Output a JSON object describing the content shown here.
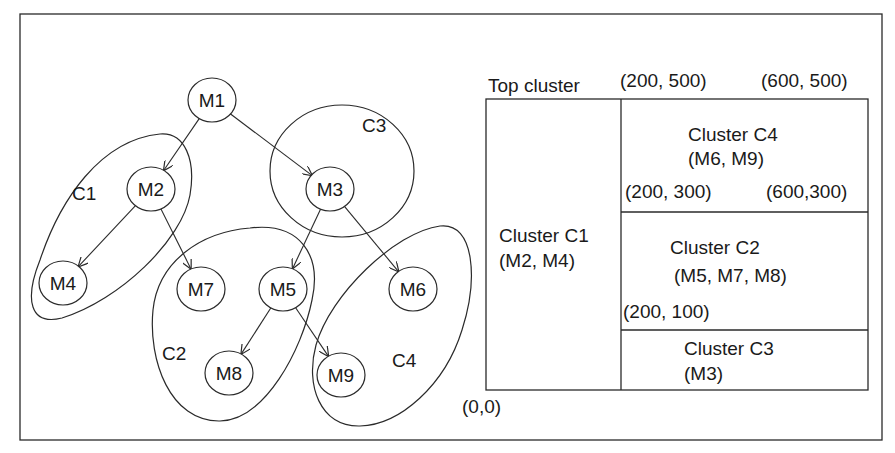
{
  "colors": {
    "stroke": "#2a2a2a",
    "text": "#1a1a1a",
    "background": "#ffffff"
  },
  "graph": {
    "nodes": [
      {
        "id": "M1",
        "label": "M1",
        "x": 212,
        "y": 100
      },
      {
        "id": "M2",
        "label": "M2",
        "x": 151,
        "y": 189
      },
      {
        "id": "M3",
        "label": "M3",
        "x": 330,
        "y": 189
      },
      {
        "id": "M4",
        "label": "M4",
        "x": 63,
        "y": 283
      },
      {
        "id": "M7",
        "label": "M7",
        "x": 201,
        "y": 289
      },
      {
        "id": "M5",
        "label": "M5",
        "x": 283,
        "y": 289
      },
      {
        "id": "M6",
        "label": "M6",
        "x": 413,
        "y": 289
      },
      {
        "id": "M8",
        "label": "M8",
        "x": 229,
        "y": 373
      },
      {
        "id": "M9",
        "label": "M9",
        "x": 341,
        "y": 375
      }
    ],
    "edges": [
      {
        "from": "M1",
        "to": "M2"
      },
      {
        "from": "M1",
        "to": "M3"
      },
      {
        "from": "M2",
        "to": "M4"
      },
      {
        "from": "M2",
        "to": "M7"
      },
      {
        "from": "M3",
        "to": "M5"
      },
      {
        "from": "M3",
        "to": "M6"
      },
      {
        "from": "M5",
        "to": "M8"
      },
      {
        "from": "M5",
        "to": "M9"
      }
    ],
    "clusters": [
      {
        "id": "C1",
        "label": "C1",
        "label_x": 72,
        "label_y": 200
      },
      {
        "id": "C2",
        "label": "C2",
        "label_x": 162,
        "label_y": 360
      },
      {
        "id": "C3",
        "label": "C3",
        "label_x": 362,
        "label_y": 132
      },
      {
        "id": "C4",
        "label": "C4",
        "label_x": 392,
        "label_y": 367
      }
    ]
  },
  "floorplan": {
    "top_label": "Top cluster",
    "corner_labels": {
      "top_left": "(200, 500)",
      "top_right": "(600, 500)",
      "mid_left": "(200, 300)",
      "mid_right": "(600,300)",
      "low_left": "(200, 100)",
      "origin": "(0,0)"
    },
    "regions": [
      {
        "id": "C1",
        "title": "Cluster C1",
        "members": "(M2, M4)"
      },
      {
        "id": "C4",
        "title": "Cluster C4",
        "members": "(M6, M9)"
      },
      {
        "id": "C2",
        "title": "Cluster C2",
        "members": "(M5, M7, M8)"
      },
      {
        "id": "C3",
        "title": "Cluster C3",
        "members": "(M3)"
      }
    ]
  }
}
